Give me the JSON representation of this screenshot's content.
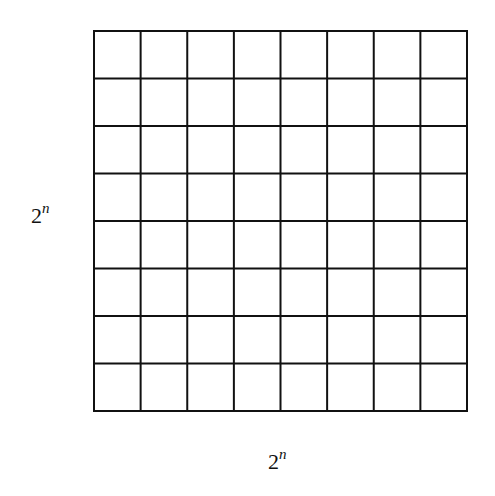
{
  "diagram": {
    "type": "grid",
    "rows": 8,
    "cols": 8,
    "line_color": "#111111",
    "labels": {
      "left": {
        "base": "2",
        "exponent": "n"
      },
      "bottom": {
        "base": "2",
        "exponent": "n"
      }
    }
  }
}
